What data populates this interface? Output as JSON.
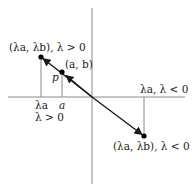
{
  "diagram": {
    "colors": {
      "axis": "#8a8a8a",
      "line": "#1a1a1a",
      "point": "#000000",
      "text": "#222222"
    },
    "labels": {
      "point_pos": "(λa, λb), λ > 0",
      "point_ab": "(a, b)",
      "p": "p",
      "lambda_a": "λa",
      "a": "a",
      "lambda_pos": "λ > 0",
      "lambda_a_neg": "λa, λ < 0",
      "point_neg": "(λa, λb), λ < 0"
    },
    "geometry": {
      "origin": [
        92,
        97
      ],
      "x_axis": [
        8,
        185
      ],
      "y_axis": [
        8,
        184
      ],
      "point_pos": [
        41,
        57
      ],
      "point_ab": [
        62,
        72
      ],
      "point_neg": [
        144,
        136
      ]
    }
  }
}
